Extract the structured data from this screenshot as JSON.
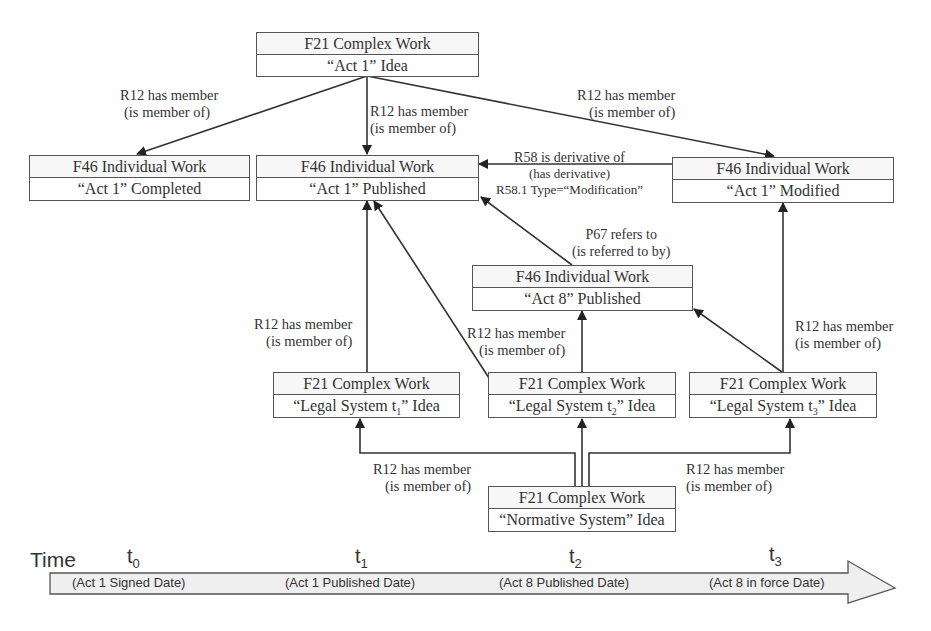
{
  "nodes": {
    "act1_idea": {
      "class": "F21 Complex Work",
      "label": "“Act 1” Idea"
    },
    "act1_completed": {
      "class": "F46 Individual Work",
      "label": "“Act 1” Completed"
    },
    "act1_published": {
      "class": "F46 Individual Work",
      "label": "“Act 1” Published"
    },
    "act1_modified": {
      "class": "F46 Individual Work",
      "label": "“Act 1” Modified"
    },
    "act8_published": {
      "class": "F46 Individual Work",
      "label": "“Act 8” Published"
    },
    "legal_t1": {
      "class": "F21 Complex Work",
      "label_pre": "“Legal System t",
      "sub": "1",
      "label_post": "” Idea"
    },
    "legal_t2": {
      "class": "F21 Complex Work",
      "label_pre": "“Legal System t",
      "sub": "2",
      "label_post": "” Idea"
    },
    "legal_t3": {
      "class": "F21 Complex Work",
      "label_pre": "“Legal System t",
      "sub": "3",
      "label_post": "” Idea"
    },
    "normative": {
      "class": "F21 Complex Work",
      "label": "“Normative System” Idea"
    }
  },
  "edges": {
    "r12_left": {
      "line1": "R12 has member",
      "line2": "(is member of)"
    },
    "r12_center": {
      "line1": "R12 has member",
      "line2": "(is member of)"
    },
    "r12_right": {
      "line1": "R12 has member",
      "line2": "(is member of)"
    },
    "r58": {
      "line1": "R58 is derivative of",
      "line2": "(has derivative)",
      "line3": "R58.1 Type=“Modification”"
    },
    "p67": {
      "line1": "P67 refers to",
      "line2": "(is referred to by)"
    },
    "r12_t1": {
      "line1": "R12 has member",
      "line2": "(is member of)"
    },
    "r12_t2": {
      "line1": "R12 has member",
      "line2": "(is member of)"
    },
    "r12_t3": {
      "line1": "R12 has member",
      "line2": "(is member of)"
    },
    "r12_norm_left": {
      "line1": "R12 has member",
      "line2": "(is member of)"
    },
    "r12_norm_right": {
      "line1": "R12 has member",
      "line2": "(is member of)"
    }
  },
  "timeline": {
    "title": "Time",
    "ticks": [
      {
        "t": "t",
        "sub": "0",
        "label": "(Act 1 Signed Date)"
      },
      {
        "t": "t",
        "sub": "1",
        "label": "(Act 1 Published Date)"
      },
      {
        "t": "t",
        "sub": "2",
        "label": "(Act 8 Published Date)"
      },
      {
        "t": "t",
        "sub": "3",
        "label": "(Act 8 in force Date)"
      }
    ]
  }
}
